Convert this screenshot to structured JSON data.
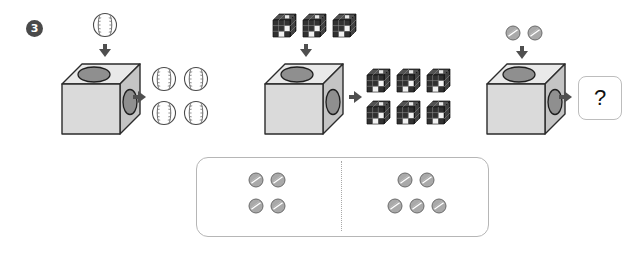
{
  "problem": {
    "number": "3",
    "type": "function-machine-pattern-puzzle"
  },
  "icons": {
    "arrow_down": "arrow-down-icon",
    "arrow_right": "arrow-right-icon",
    "machine": "machine-box-icon",
    "baseball": "baseball-icon",
    "block": "dark-cube-block-icon",
    "coin": "coin-icon"
  },
  "examples": [
    {
      "id": "example-1",
      "input_label": "1 baseball",
      "input_count": 1,
      "input_item": "baseball",
      "output_label": "4 baseballs",
      "output_count": 4,
      "output_item": "baseball",
      "output_rows": [
        2,
        2
      ]
    },
    {
      "id": "example-2",
      "input_label": "3 blocks",
      "input_count": 3,
      "input_item": "block",
      "output_label": "6 blocks",
      "output_count": 6,
      "output_item": "block",
      "output_rows": [
        3,
        3
      ]
    },
    {
      "id": "example-3-question",
      "input_label": "2 coins",
      "input_count": 2,
      "input_item": "coin",
      "output_label": "?",
      "output_count": null,
      "output_item": "coin"
    }
  ],
  "question_box": {
    "label": "?"
  },
  "answer_options": [
    {
      "id": "option-left",
      "item": "coin",
      "count": 4,
      "rows": [
        2,
        2
      ]
    },
    {
      "id": "option-right",
      "item": "coin",
      "count": 5,
      "rows": [
        2,
        3
      ]
    }
  ],
  "colors": {
    "badge_fill": "#4a4a4a",
    "badge_text": "#ffffff",
    "arrow": "#4f4f4f",
    "machine_top": "#e6e6e6",
    "machine_front": "#dcdcdc",
    "machine_side": "#c9c9c9",
    "machine_stroke": "#2b2b2b",
    "hole_fill": "#8f8f8f",
    "baseball_fill": "#ffffff",
    "baseball_stroke": "#555555",
    "block_dark": "#2e2e2e",
    "block_light": "#f0f0f0",
    "coin_fill": "#a9a9a9",
    "coin_stroke": "#6e6e6e",
    "panel_border": "#b6b6b6",
    "divider": "#a8a8a8",
    "question_border": "#bdbdbd"
  }
}
